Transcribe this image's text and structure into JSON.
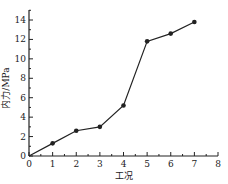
{
  "chart_data": {
    "type": "line",
    "title": "",
    "xlabel": "工况",
    "ylabel": "内力/MPa",
    "x": [
      0,
      1,
      2,
      3,
      4,
      5,
      6,
      7
    ],
    "series": [
      {
        "name": "内力",
        "values": [
          0,
          1.3,
          2.6,
          3.0,
          5.2,
          11.8,
          12.6,
          13.8
        ],
        "markers": [
          false,
          true,
          true,
          true,
          true,
          true,
          true,
          true
        ]
      }
    ],
    "xlim": [
      0,
      8
    ],
    "ylim": [
      0,
      15
    ],
    "xticks": [
      "0",
      "1",
      "2",
      "3",
      "4",
      "5",
      "6",
      "7",
      "8"
    ],
    "yticks": [
      "0",
      "2",
      "4",
      "6",
      "8",
      "10",
      "12",
      "14"
    ],
    "grid": false,
    "legend": "none",
    "colors": {
      "line": "#222222",
      "axis": "#222222"
    }
  }
}
